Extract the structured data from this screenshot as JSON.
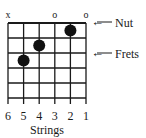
{
  "diagram": {
    "type": "guitar-chord-chart",
    "strings": 6,
    "frets_shown": 5,
    "string_numbers": [
      "6",
      "5",
      "4",
      "3",
      "2",
      "1"
    ],
    "open_muted_markers": [
      "x",
      "",
      "",
      "o",
      "",
      "o"
    ],
    "finger_positions": [
      {
        "string": 2,
        "fret": 1
      },
      {
        "string": 4,
        "fret": 2
      },
      {
        "string": 5,
        "fret": 3
      }
    ],
    "labels": {
      "nut": "Nut",
      "frets": "Frets",
      "strings_axis": "Strings",
      "arrow": "←"
    },
    "colors": {
      "line": "#1a1a1a",
      "dot": "#111111",
      "background": "#ffffff"
    }
  }
}
